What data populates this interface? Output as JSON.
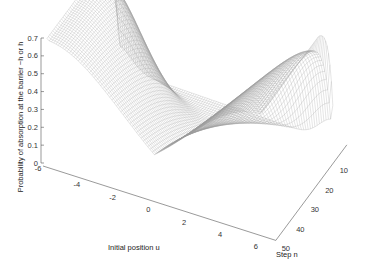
{
  "chart_data": {
    "type": "surface",
    "title": "",
    "xlabel": "Initial position u",
    "ylabel": "Step n",
    "zlabel": "Probability of absorption at the barrier −h or h",
    "x_ticks": [
      "-6",
      "-4",
      "-2",
      "0",
      "2",
      "4",
      "6"
    ],
    "x_tick_values": [
      -6,
      -4,
      -2,
      0,
      2,
      4,
      6
    ],
    "y_ticks": [
      "10",
      "20",
      "30",
      "40",
      "50"
    ],
    "y_tick_values": [
      10,
      20,
      30,
      40,
      50
    ],
    "z_ticks": [
      "0",
      "0.1",
      "0.2",
      "0.3",
      "0.4",
      "0.5",
      "0.6",
      "0.7"
    ],
    "z_tick_values": [
      0,
      0.1,
      0.2,
      0.3,
      0.4,
      0.5,
      0.6,
      0.7
    ],
    "xlim": [
      -6,
      6
    ],
    "ylim": [
      1,
      50
    ],
    "zlim": [
      0,
      0.7
    ],
    "grid": false,
    "style": "wireframe mesh, gray lines on white",
    "surface_samples": {
      "u": [
        -6,
        -5,
        -4,
        -3,
        -2,
        -1,
        0,
        1,
        2,
        3,
        4,
        5,
        6
      ],
      "n": [
        1,
        10,
        20,
        30,
        40,
        50
      ],
      "z_at_boundary_by_n": [
        0.05,
        0.55,
        0.62,
        0.66,
        0.68,
        0.69
      ],
      "z_at_center_by_n": [
        0.0,
        0.0,
        0.01,
        0.02,
        0.03,
        0.04
      ]
    }
  },
  "colors": {
    "background": "#ffffff",
    "mesh": "#9a9a9a",
    "axis": "#555555",
    "text": "#333333"
  }
}
